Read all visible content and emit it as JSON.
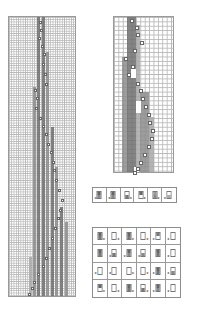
{
  "figure": {
    "type": "cellular-automaton-diagram",
    "colors": {
      "background": "#ffffff",
      "grid_line": "#b9b9b9",
      "border": "#9a9a9a",
      "dark_stripe": "#6e6e6e",
      "mid_stripe": "#8c8c8c",
      "light_stripe": "#a8a8a8",
      "marker": "#ffffff"
    }
  },
  "left_grid": {
    "x": 8,
    "y": 16,
    "width": 68,
    "height": 281,
    "cell": 2.3,
    "stripes": [
      {
        "x": 28,
        "y": 0,
        "w": 3,
        "h": 281,
        "shade": "dark"
      },
      {
        "x": 33,
        "y": 0,
        "w": 3,
        "h": 281,
        "shade": "dark"
      },
      {
        "x": 24,
        "y": 70,
        "w": 3,
        "h": 211,
        "shade": "mid"
      },
      {
        "x": 37,
        "y": 35,
        "w": 3,
        "h": 246,
        "shade": "mid"
      },
      {
        "x": 42,
        "y": 110,
        "w": 3,
        "h": 171,
        "shade": "dark"
      },
      {
        "x": 46,
        "y": 150,
        "w": 3,
        "h": 131,
        "shade": "mid"
      },
      {
        "x": 51,
        "y": 190,
        "w": 3,
        "h": 91,
        "shade": "dark"
      },
      {
        "x": 56,
        "y": 205,
        "w": 3,
        "h": 76,
        "shade": "mid"
      },
      {
        "x": 20,
        "y": 240,
        "w": 3,
        "h": 41,
        "shade": "light"
      }
    ],
    "markers": [
      [
        30,
        4
      ],
      [
        31,
        12
      ],
      [
        29,
        20
      ],
      [
        32,
        28
      ],
      [
        34,
        36
      ],
      [
        33,
        46
      ],
      [
        35,
        56
      ],
      [
        36,
        66
      ],
      [
        25,
        72
      ],
      [
        27,
        80
      ],
      [
        26,
        90
      ],
      [
        30,
        100
      ],
      [
        33,
        108
      ],
      [
        36,
        116
      ],
      [
        38,
        126
      ],
      [
        41,
        134
      ],
      [
        43,
        144
      ],
      [
        44,
        152
      ],
      [
        46,
        162
      ],
      [
        49,
        172
      ],
      [
        52,
        182
      ],
      [
        50,
        192
      ],
      [
        48,
        200
      ],
      [
        45,
        210
      ],
      [
        42,
        220
      ],
      [
        39,
        230
      ],
      [
        36,
        240
      ],
      [
        33,
        248
      ],
      [
        28,
        256
      ],
      [
        24,
        264
      ],
      [
        22,
        270
      ],
      [
        19,
        276
      ]
    ]
  },
  "right_grid": {
    "x": 113,
    "y": 16,
    "width": 61,
    "height": 157,
    "cell": 4.4,
    "stripes": [
      {
        "x": 13,
        "y": 0,
        "w": 9,
        "h": 157,
        "shade": "dark"
      },
      {
        "x": 22,
        "y": 8,
        "w": 4,
        "h": 149,
        "shade": "light"
      },
      {
        "x": 8,
        "y": 40,
        "w": 5,
        "h": 117,
        "shade": "mid"
      },
      {
        "x": 26,
        "y": 75,
        "w": 9,
        "h": 82,
        "shade": "mid"
      },
      {
        "x": 35,
        "y": 100,
        "w": 5,
        "h": 57,
        "shade": "light"
      }
    ],
    "markers": [
      [
        16,
        2
      ],
      [
        21,
        9
      ],
      [
        22,
        16
      ],
      [
        26,
        24
      ],
      [
        19,
        32
      ],
      [
        10,
        40
      ],
      [
        17,
        48
      ],
      [
        13,
        56
      ],
      [
        22,
        65
      ],
      [
        25,
        72
      ],
      [
        27,
        80
      ],
      [
        30,
        88
      ],
      [
        33,
        96
      ],
      [
        34,
        104
      ],
      [
        37,
        112
      ],
      [
        36,
        120
      ],
      [
        33,
        128
      ],
      [
        29,
        136
      ],
      [
        25,
        144
      ],
      [
        22,
        150
      ],
      [
        19,
        154
      ]
    ],
    "white_blocks": [
      {
        "x": 17,
        "y": 52,
        "w": 5,
        "h": 9
      },
      {
        "x": 22,
        "y": 84,
        "w": 5,
        "h": 12
      },
      {
        "x": 20,
        "y": 150,
        "w": 5,
        "h": 5
      }
    ]
  },
  "rule_row": {
    "x": 92,
    "y": 187,
    "width": 85,
    "height": 16,
    "cols": 6,
    "rows": 1,
    "tiles": [
      {
        "top": "#666",
        "bot": "#888",
        "arrow": "left",
        "arrow_label": "◂"
      },
      {
        "top": "#666",
        "bot": "#888",
        "arrow": "left",
        "arrow_label": "◂"
      },
      {
        "top": "#fff",
        "bot": "#777",
        "arrow": "right",
        "arrow_label": "▸"
      },
      {
        "top": "#666",
        "bot": "#fff",
        "arrow": "right",
        "arrow_label": "▸"
      },
      {
        "top": "#999",
        "bot": "#888",
        "arrow": "right",
        "arrow_label": "▸"
      },
      {
        "top": "#fff",
        "bot": "#aaa",
        "arrow": "left",
        "arrow_label": "◂"
      }
    ]
  },
  "rule_table": {
    "x": 92,
    "y": 227,
    "width": 89,
    "height": 71,
    "cols": 6,
    "rows": 4,
    "tiles": [
      {
        "top": "#666",
        "bot": "#777",
        "arrow": "right",
        "arrow_label": "▸"
      },
      {
        "top": "#fff",
        "bot": "#fff",
        "arrow": "right",
        "arrow_label": "▸"
      },
      {
        "top": "#666",
        "bot": "#777",
        "arrow": "right",
        "arrow_label": "▸"
      },
      {
        "top": "#fff",
        "bot": "#fff",
        "arrow": "right",
        "arrow_label": "▸"
      },
      {
        "top": "#777",
        "bot": "#fff",
        "arrow": "left",
        "arrow_label": "◂"
      },
      {
        "top": "#fff",
        "bot": "#fff",
        "arrow": "left",
        "arrow_label": "◂"
      },
      {
        "top": "#666",
        "bot": "#777",
        "arrow": "none",
        "arrow_label": ""
      },
      {
        "top": "#fff",
        "bot": "#777",
        "arrow": "left",
        "arrow_label": "◂"
      },
      {
        "top": "#666",
        "bot": "#888",
        "arrow": "left",
        "arrow_label": "◂"
      },
      {
        "top": "#fff",
        "bot": "#888",
        "arrow": "left",
        "arrow_label": "◂"
      },
      {
        "top": "#666",
        "bot": "#777",
        "arrow": "none",
        "arrow_label": ""
      },
      {
        "top": "#fff",
        "bot": "#fff",
        "arrow": "left",
        "arrow_label": "◂"
      },
      {
        "top": "#fff",
        "bot": "#fff",
        "arrow": "left",
        "arrow_label": "◂"
      },
      {
        "top": "#fff",
        "bot": "#fff",
        "arrow": "left",
        "arrow_label": "◂"
      },
      {
        "top": "#fff",
        "bot": "#fff",
        "arrow": "right",
        "arrow_label": "▸"
      },
      {
        "top": "#fff",
        "bot": "#fff",
        "arrow": "right",
        "arrow_label": "▸"
      },
      {
        "top": "#666",
        "bot": "#777",
        "arrow": "left",
        "arrow_label": "◂"
      },
      {
        "top": "#fff",
        "bot": "#888",
        "arrow": "left",
        "arrow_label": "◂"
      },
      {
        "top": "#666",
        "bot": "#fff",
        "arrow": "right",
        "arrow_label": "▸"
      },
      {
        "top": "#fff",
        "bot": "#fff",
        "arrow": "right",
        "arrow_label": "▸"
      },
      {
        "top": "#666",
        "bot": "#777",
        "arrow": "right",
        "arrow_label": "▸"
      },
      {
        "top": "#fff",
        "bot": "#777",
        "arrow": "right",
        "arrow_label": "▸"
      },
      {
        "top": "#666",
        "bot": "#888",
        "arrow": "left",
        "arrow_label": "◂"
      },
      {
        "top": "#fff",
        "bot": "#fff",
        "arrow": "left",
        "arrow_label": "◂"
      }
    ]
  }
}
